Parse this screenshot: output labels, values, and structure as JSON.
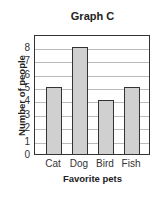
{
  "chart_data": {
    "type": "bar",
    "title": "Graph C",
    "xlabel": "Favorite pets",
    "ylabel": "Number of people",
    "categories": [
      "Cat",
      "Dog",
      "Bird",
      "Fish"
    ],
    "values": [
      5,
      8,
      4,
      5
    ],
    "ylim": [
      0,
      8.9
    ],
    "yticks": [
      0,
      1,
      2,
      3,
      4,
      5,
      6,
      7,
      8
    ],
    "grid": true,
    "bar_color": "#d0d0d0",
    "legend": null
  }
}
